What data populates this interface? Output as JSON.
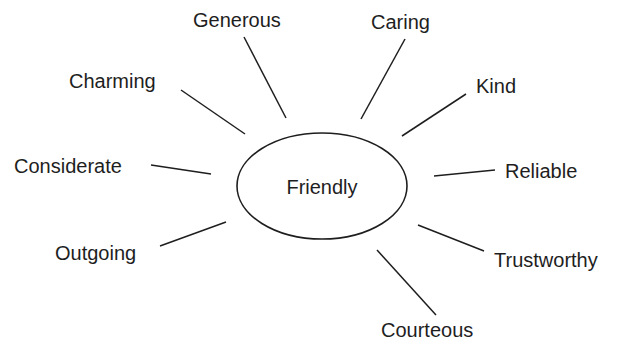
{
  "diagram": {
    "type": "mind-map",
    "center": {
      "label": "Friendly"
    },
    "nodes": [
      {
        "id": "generous",
        "label": "Generous"
      },
      {
        "id": "caring",
        "label": "Caring"
      },
      {
        "id": "kind",
        "label": "Kind"
      },
      {
        "id": "reliable",
        "label": "Reliable"
      },
      {
        "id": "trustworthy",
        "label": "Trustworthy"
      },
      {
        "id": "courteous",
        "label": "Courteous"
      },
      {
        "id": "outgoing",
        "label": "Outgoing"
      },
      {
        "id": "considerate",
        "label": "Considerate"
      },
      {
        "id": "charming",
        "label": "Charming"
      }
    ],
    "edges": [
      {
        "from": "Friendly",
        "to": "Generous"
      },
      {
        "from": "Friendly",
        "to": "Caring"
      },
      {
        "from": "Friendly",
        "to": "Kind"
      },
      {
        "from": "Friendly",
        "to": "Reliable"
      },
      {
        "from": "Friendly",
        "to": "Trustworthy"
      },
      {
        "from": "Friendly",
        "to": "Courteous"
      },
      {
        "from": "Friendly",
        "to": "Outgoing"
      },
      {
        "from": "Friendly",
        "to": "Considerate"
      },
      {
        "from": "Friendly",
        "to": "Charming"
      }
    ],
    "colors": {
      "ink": "#1e1e1e",
      "background": "#ffffff"
    }
  }
}
